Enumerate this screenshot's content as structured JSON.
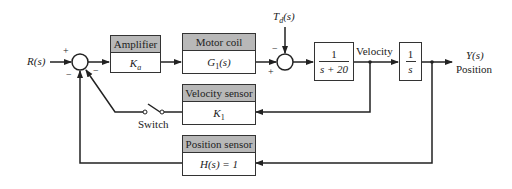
{
  "diagram": {
    "input": {
      "label": "R(s)"
    },
    "disturbance": {
      "label": "T_d(s)",
      "base": "T",
      "sub": "d",
      "rest": "(s)"
    },
    "output": {
      "label": "Y(s)",
      "sublabel": "Position"
    },
    "signals": {
      "velocity": "Velocity"
    },
    "switch": {
      "label": "Switch",
      "state": "open"
    },
    "summing_junctions": [
      {
        "id": "sum1",
        "signs": {
          "input_left": "+",
          "velocity_feedback": "−",
          "position_feedback": "−"
        }
      },
      {
        "id": "sum2",
        "signs": {
          "top": "−",
          "left": "+"
        }
      }
    ],
    "blocks": {
      "amplifier": {
        "title": "Amplifier",
        "gain": "K",
        "gain_sub": "a"
      },
      "motor_coil": {
        "title": "Motor coil",
        "tf": "G",
        "tf_sub": "1",
        "tf_rest": "(s)"
      },
      "plant": {
        "numerator": "1",
        "denominator": "s + 20"
      },
      "integrator": {
        "numerator": "1",
        "denominator": "s"
      },
      "velocity_sensor": {
        "title": "Velocity sensor",
        "gain": "K",
        "gain_sub": "1"
      },
      "position_sensor": {
        "title": "Position sensor",
        "tf": "H(s) = 1"
      }
    },
    "colors": {
      "line": "#222222",
      "header": "#b8b8b8",
      "background": "#ffffff"
    }
  }
}
